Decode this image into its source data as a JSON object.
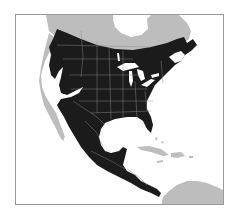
{
  "map": {
    "type": "species-range-map",
    "region": "North America, Central America and Caribbean",
    "colors": {
      "range": "#1b1b1b",
      "land": "#bdbdbd",
      "water": "#ffffff",
      "borders": "#8a8a8a",
      "frame": "#9a9a9a"
    },
    "legend": {
      "range_label": "Range"
    }
  }
}
